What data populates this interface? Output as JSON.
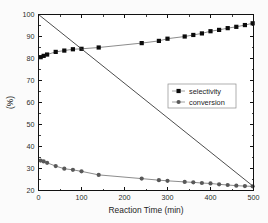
{
  "chart_data": {
    "type": "line",
    "title": "",
    "subtitle": "",
    "xlabel": "Reaction Time (min)",
    "ylabel": "(%)",
    "xlim": [
      0,
      500
    ],
    "ylim": [
      20,
      100
    ],
    "xticks": [
      0,
      100,
      200,
      300,
      400,
      500
    ],
    "yticks": [
      20,
      30,
      40,
      50,
      60,
      70,
      80,
      90,
      100
    ],
    "xtick_labels": [
      "0",
      "100",
      "200",
      "300",
      "400",
      "500"
    ],
    "ytick_labels": [
      "20",
      "30",
      "40",
      "50",
      "60",
      "70",
      "80",
      "90",
      "100"
    ],
    "grid": false,
    "legend_position": "center-right",
    "series": [
      {
        "name": "selectivity",
        "marker": "square",
        "color": "#0b0b0b",
        "x": [
          5,
          12,
          20,
          40,
          60,
          80,
          100,
          140,
          240,
          280,
          300,
          340,
          360,
          380,
          400,
          420,
          440,
          460,
          480,
          498
        ],
        "y": [
          80.6,
          81.2,
          81.8,
          83.0,
          83.6,
          84.2,
          84.4,
          85.0,
          87.0,
          88.0,
          89.0,
          90.0,
          90.7,
          91.4,
          92.4,
          93.0,
          93.8,
          94.4,
          95.2,
          96.0
        ]
      },
      {
        "name": "conversion",
        "marker": "circle",
        "color": "#585858",
        "x": [
          5,
          12,
          20,
          40,
          60,
          80,
          100,
          140,
          240,
          280,
          300,
          340,
          360,
          380,
          400,
          420,
          440,
          460,
          480,
          498
        ],
        "y": [
          33.6,
          33.2,
          32.6,
          31.1,
          29.9,
          29.4,
          28.7,
          27.1,
          25.4,
          24.7,
          24.4,
          23.9,
          23.7,
          23.4,
          23.2,
          22.8,
          22.5,
          22.2,
          22.0,
          21.9
        ]
      },
      {
        "name": "reference-line",
        "marker": "none",
        "color": "#3a3a3a",
        "x": [
          0,
          500
        ],
        "y": [
          100,
          21.8
        ]
      }
    ],
    "legend_entries": [
      {
        "label": "selectivity",
        "marker": "square",
        "color": "#0b0b0b"
      },
      {
        "label": "conversion",
        "marker": "circle",
        "color": "#585858"
      }
    ]
  },
  "figure": {
    "background": "#fbfbfb",
    "plot_background": "#ffffff",
    "frame_color": "#111111"
  }
}
